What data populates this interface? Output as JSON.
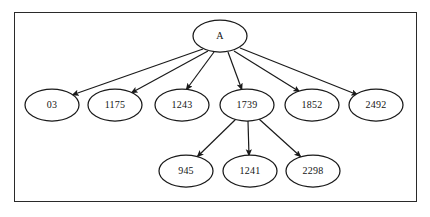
{
  "diagram": {
    "type": "tree",
    "frame": {
      "visible": true,
      "border_color": "#2a2a2a"
    },
    "background_color": "#ffffff",
    "node_stroke_color": "#1a1a1a",
    "edge_color": "#1a1a1a",
    "root": {
      "id": "A",
      "label": "A",
      "cx": 220,
      "cy": 36,
      "rx": 27,
      "ry": 16
    },
    "level1": [
      {
        "id": "n03",
        "label": "03",
        "cx": 52,
        "cy": 105,
        "rx": 27,
        "ry": 16
      },
      {
        "id": "n1175",
        "label": "1175",
        "cx": 115,
        "cy": 105,
        "rx": 27,
        "ry": 16
      },
      {
        "id": "n1243",
        "label": "1243",
        "cx": 182,
        "cy": 105,
        "rx": 27,
        "ry": 16
      },
      {
        "id": "n1739",
        "label": "1739",
        "cx": 247,
        "cy": 105,
        "rx": 27,
        "ry": 16
      },
      {
        "id": "n1852",
        "label": "1852",
        "cx": 312,
        "cy": 105,
        "rx": 27,
        "ry": 16
      },
      {
        "id": "n2492",
        "label": "2492",
        "cx": 376,
        "cy": 105,
        "rx": 27,
        "ry": 16
      }
    ],
    "level2": [
      {
        "id": "n945",
        "label": "945",
        "cx": 186,
        "cy": 171,
        "rx": 27,
        "ry": 16
      },
      {
        "id": "n1241",
        "label": "1241",
        "cx": 250,
        "cy": 171,
        "rx": 27,
        "ry": 16
      },
      {
        "id": "n2298",
        "label": "2298",
        "cx": 313,
        "cy": 171,
        "rx": 27,
        "ry": 16
      }
    ],
    "edges": [
      {
        "from": "A",
        "to": "n03",
        "x1": 203,
        "y1": 49,
        "x2": 72,
        "y2": 95
      },
      {
        "from": "A",
        "to": "n1175",
        "x1": 208,
        "y1": 51,
        "x2": 131,
        "y2": 93
      },
      {
        "from": "A",
        "to": "n1243",
        "x1": 214,
        "y1": 52,
        "x2": 186,
        "y2": 90
      },
      {
        "from": "A",
        "to": "n1739",
        "x1": 228,
        "y1": 52,
        "x2": 242,
        "y2": 90
      },
      {
        "from": "A",
        "to": "n1852",
        "x1": 234,
        "y1": 51,
        "x2": 300,
        "y2": 92
      },
      {
        "from": "A",
        "to": "n2492",
        "x1": 240,
        "y1": 48,
        "x2": 358,
        "y2": 95
      },
      {
        "from": "n1739",
        "to": "n945",
        "x1": 236,
        "y1": 119,
        "x2": 197,
        "y2": 157
      },
      {
        "from": "n1739",
        "to": "n1241",
        "x1": 248,
        "y1": 121,
        "x2": 249,
        "y2": 156
      },
      {
        "from": "n1739",
        "to": "n2298",
        "x1": 259,
        "y1": 119,
        "x2": 301,
        "y2": 157
      }
    ]
  }
}
